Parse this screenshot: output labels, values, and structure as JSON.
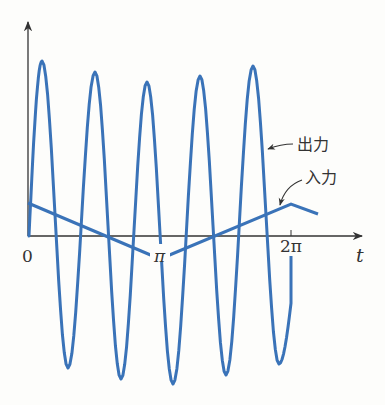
{
  "figure": {
    "type": "diagram",
    "colors": {
      "curve": "#3a73b8",
      "axis": "#333333",
      "background": "#fdfdfb"
    },
    "axis": {
      "origin_label": "0",
      "x_label": "t",
      "ticks": [
        {
          "label": "π",
          "x": 160
        },
        {
          "label": "2π",
          "x": 291
        }
      ]
    },
    "labels": {
      "output": "出力",
      "input": "入力"
    }
  },
  "chart_data": {
    "type": "line",
    "title": "",
    "xlabel": "t",
    "ylabel": "",
    "x_ticks": [
      "0",
      "π",
      "2π"
    ],
    "series": [
      {
        "name": "入力",
        "shape": "triangle",
        "points": [
          [
            0,
            0.15
          ],
          [
            3.1416,
            -0.11
          ],
          [
            6.2832,
            0.15
          ],
          [
            7.6,
            0.1
          ]
        ]
      },
      {
        "name": "出力",
        "shape": "oscillation",
        "approx_period": 1.2,
        "cycles": 5.5,
        "peaks": [
          0.82,
          0.77,
          0.72,
          0.75,
          0.8
        ],
        "troughs": [
          -0.62,
          -0.67,
          -0.7,
          -0.66,
          -0.6
        ]
      }
    ],
    "grid": false,
    "legend": "inline labels with arrows"
  }
}
